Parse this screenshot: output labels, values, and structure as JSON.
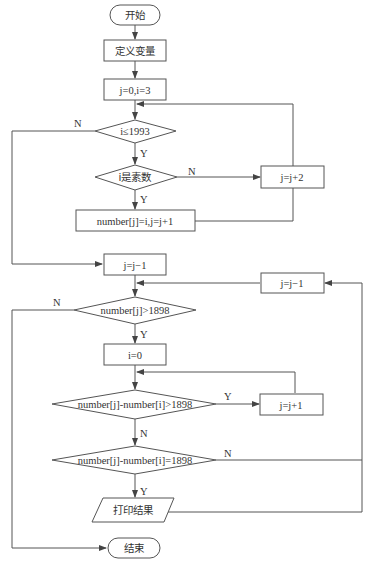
{
  "flowchart": {
    "nodes": {
      "start": "开始",
      "define_vars": "定义变量",
      "init": "j=0,i=3",
      "cond_range": "i≤1993",
      "cond_prime": "i是素数",
      "store_prime": "number[j]=i,j=j+1",
      "step_i": "j=j+2",
      "dec_j_1": "j=j−1",
      "cond_gt": "number[j]>1898",
      "reset_i": "i=0",
      "cond_diff_gt": "number[j]-number[i]>1898",
      "inc_i": "j=j+1",
      "cond_diff_eq": "number[j]-number[i]=1898",
      "dec_j_2": "j=j−1",
      "print": "打印结果",
      "end": "结束"
    },
    "edge_labels": {
      "range_no": "N",
      "range_yes": "Y",
      "prime_no": "N",
      "prime_yes": "Y",
      "gt_no": "N",
      "gt_yes": "Y",
      "diff_gt_yes": "Y",
      "diff_gt_no": "N",
      "diff_eq_no": "N",
      "diff_eq_yes": "Y"
    }
  }
}
